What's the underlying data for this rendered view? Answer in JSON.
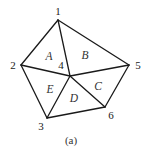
{
  "diagram": {
    "type": "triangulated-polygon",
    "caption": "(a)",
    "colors": {
      "edge": "#1a1a1a",
      "text": "#222222",
      "background": "#ffffff"
    },
    "vertices": [
      {
        "id": "1",
        "label": "1",
        "x": 58,
        "y": 20,
        "lx": 58,
        "ly": 11
      },
      {
        "id": "2",
        "label": "2",
        "x": 21,
        "y": 65,
        "lx": 13,
        "ly": 65
      },
      {
        "id": "3",
        "label": "3",
        "x": 47,
        "y": 118,
        "lx": 41,
        "ly": 126
      },
      {
        "id": "4",
        "label": "4",
        "x": 70,
        "y": 76,
        "lx": 61,
        "ly": 65
      },
      {
        "id": "5",
        "label": "5",
        "x": 129,
        "y": 65,
        "lx": 138,
        "ly": 65
      },
      {
        "id": "6",
        "label": "6",
        "x": 105,
        "y": 107,
        "lx": 111,
        "ly": 115
      }
    ],
    "edges": [
      [
        "1",
        "2"
      ],
      [
        "1",
        "5"
      ],
      [
        "1",
        "4"
      ],
      [
        "2",
        "4"
      ],
      [
        "2",
        "3"
      ],
      [
        "3",
        "4"
      ],
      [
        "3",
        "6"
      ],
      [
        "4",
        "5"
      ],
      [
        "4",
        "6"
      ],
      [
        "5",
        "6"
      ]
    ],
    "regions": [
      {
        "label": "A",
        "vertices": [
          "1",
          "2",
          "4"
        ],
        "x": 49,
        "y": 56
      },
      {
        "label": "B",
        "vertices": [
          "1",
          "4",
          "5"
        ],
        "x": 85,
        "y": 55
      },
      {
        "label": "C",
        "vertices": [
          "4",
          "5",
          "6"
        ],
        "x": 98,
        "y": 86
      },
      {
        "label": "D",
        "vertices": [
          "3",
          "4",
          "6"
        ],
        "x": 74,
        "y": 98
      },
      {
        "label": "E",
        "vertices": [
          "2",
          "3",
          "4"
        ],
        "x": 50,
        "y": 89
      }
    ],
    "caption_pos": {
      "x": 71,
      "y": 140
    }
  }
}
